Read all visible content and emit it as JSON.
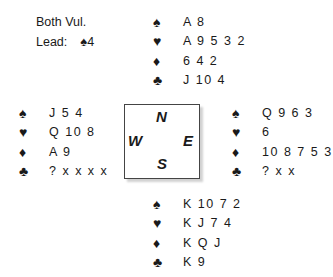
{
  "info": {
    "vulnerability": "Both Vul.",
    "lead_label": "Lead:",
    "lead_suit": "♠",
    "lead_card": "4"
  },
  "suit_symbols": {
    "spades": "♠",
    "hearts": "♥",
    "diamonds": "♦",
    "clubs": "♣"
  },
  "hands": {
    "north": {
      "spades": "A 8",
      "hearts": "A 9 5 3 2",
      "diamonds": "6 4 2",
      "clubs": "J 10 4"
    },
    "west": {
      "spades": "J 5 4",
      "hearts": "Q 10 8",
      "diamonds": "A 9",
      "clubs": "? x x x x"
    },
    "east": {
      "spades": "Q 9 6 3",
      "hearts": "6",
      "diamonds": "10 8 7 5 3",
      "clubs": "? x x"
    },
    "south": {
      "spades": "K 10 7 2",
      "hearts": "K J 7 4",
      "diamonds": "K Q J",
      "clubs": "K 9"
    }
  },
  "compass": {
    "north": "N",
    "south": "S",
    "east": "E",
    "west": "W"
  }
}
